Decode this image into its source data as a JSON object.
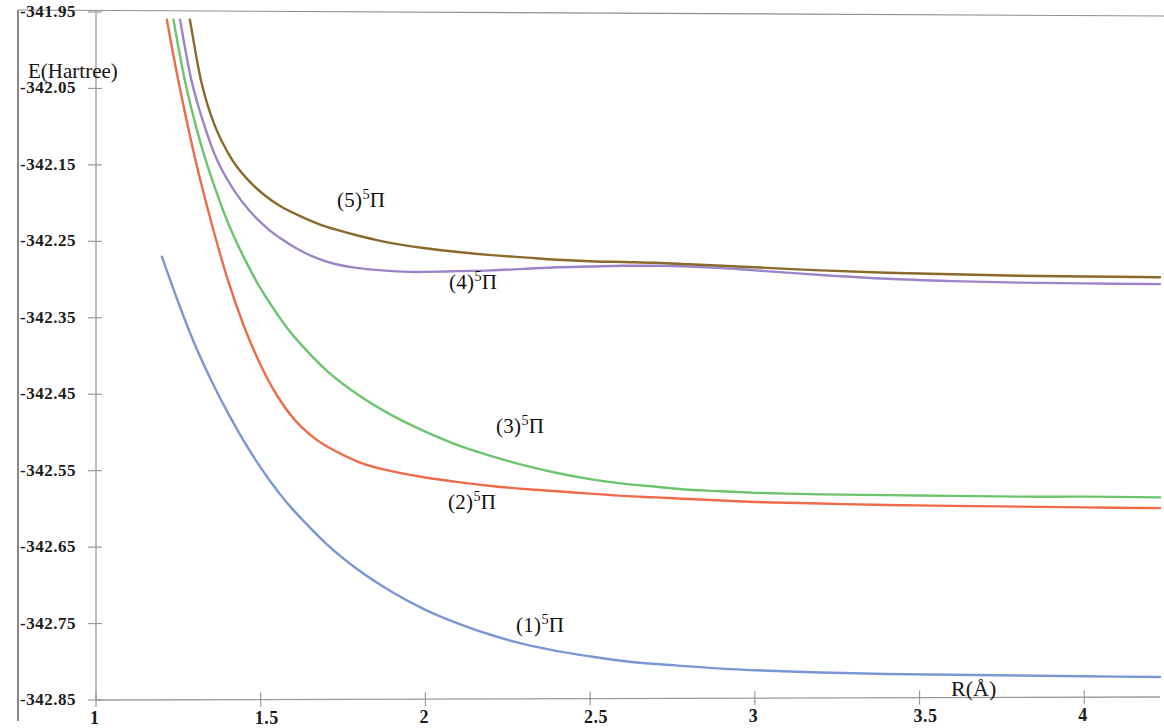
{
  "chart_data": {
    "type": "line",
    "title": "",
    "subtitle": "",
    "xlabel": "R(Å)",
    "ylabel": "E(Hartree)",
    "xlim": [
      1,
      4.23
    ],
    "ylim": [
      -342.85,
      -341.95
    ],
    "grid": false,
    "legend_position": "inline-labels",
    "x_ticks": [
      "1",
      "1.5",
      "2",
      "2.5",
      "3",
      "3.5",
      "4"
    ],
    "x_tick_values": [
      1,
      1.5,
      2,
      2.5,
      3,
      3.5,
      4
    ],
    "y_ticks": [
      "-341.95",
      "-342.05",
      "-342.15",
      "-342.25",
      "-342.35",
      "-342.45",
      "-342.55",
      "-342.65",
      "-342.75",
      "-342.85"
    ],
    "y_tick_values": [
      -341.95,
      -342.05,
      -342.15,
      -342.25,
      -342.35,
      -342.45,
      -342.55,
      -342.65,
      -342.75,
      -342.85
    ],
    "series": [
      {
        "name": "(1)5Pi",
        "label_html": "(1)<sup>5</sup>Π",
        "color": "#7a97d4",
        "x": [
          1.2,
          1.25,
          1.3,
          1.35,
          1.4,
          1.45,
          1.5,
          1.55,
          1.6,
          1.7,
          1.8,
          1.9,
          2.0,
          2.1,
          2.2,
          2.3,
          2.4,
          2.5,
          2.6,
          2.7,
          2.8,
          2.9,
          3.0,
          3.2,
          3.4,
          3.6,
          3.8,
          4.0,
          4.23
        ],
        "y": [
          -342.27,
          -342.33,
          -342.385,
          -342.432,
          -342.474,
          -342.512,
          -342.546,
          -342.576,
          -342.602,
          -342.646,
          -342.681,
          -342.709,
          -342.732,
          -342.75,
          -342.765,
          -342.777,
          -342.786,
          -342.793,
          -342.799,
          -342.803,
          -342.806,
          -342.809,
          -342.811,
          -342.814,
          -342.816,
          -342.817,
          -342.818,
          -342.819,
          -342.82
        ]
      },
      {
        "name": "(2)5Pi",
        "label_html": "(2)<sup>5</sup>Π",
        "color": "#ed6b48",
        "x": [
          1.215,
          1.25,
          1.3,
          1.35,
          1.4,
          1.45,
          1.5,
          1.55,
          1.6,
          1.65,
          1.7,
          1.8,
          1.9,
          2.0,
          2.1,
          2.2,
          2.3,
          2.4,
          2.5,
          2.6,
          2.7,
          2.8,
          2.9,
          3.0,
          3.2,
          3.4,
          3.6,
          3.8,
          4.0,
          4.23
        ],
        "y": [
          -341.96,
          -342.04,
          -342.14,
          -342.225,
          -342.3,
          -342.362,
          -342.412,
          -342.452,
          -342.482,
          -342.503,
          -342.518,
          -342.539,
          -342.551,
          -342.559,
          -342.565,
          -342.57,
          -342.574,
          -342.577,
          -342.58,
          -342.583,
          -342.585,
          -342.587,
          -342.589,
          -342.591,
          -342.593,
          -342.595,
          -342.596,
          -342.597,
          -342.598,
          -342.599
        ]
      },
      {
        "name": "(3)5Pi",
        "label_html": "(3)<sup>5</sup>Π",
        "color": "#6ec46e",
        "x": [
          1.235,
          1.27,
          1.31,
          1.35,
          1.4,
          1.45,
          1.5,
          1.55,
          1.6,
          1.7,
          1.8,
          1.9,
          2.0,
          2.1,
          2.2,
          2.3,
          2.4,
          2.5,
          2.6,
          2.7,
          2.8,
          2.9,
          3.0,
          3.2,
          3.4,
          3.6,
          3.8,
          4.0,
          4.23
        ],
        "y": [
          -341.96,
          -342.04,
          -342.11,
          -342.166,
          -342.225,
          -342.272,
          -342.312,
          -342.345,
          -342.374,
          -342.419,
          -342.452,
          -342.478,
          -342.499,
          -342.517,
          -342.531,
          -342.543,
          -342.553,
          -342.561,
          -342.567,
          -342.571,
          -342.575,
          -342.577,
          -342.579,
          -342.581,
          -342.582,
          -342.583,
          -342.584,
          -342.584,
          -342.585
        ]
      },
      {
        "name": "(4)5Pi",
        "label_html": "(4)<sup>5</sup>Π",
        "color": "#9b85c8",
        "x": [
          1.255,
          1.29,
          1.33,
          1.37,
          1.42,
          1.47,
          1.52,
          1.57,
          1.62,
          1.67,
          1.72,
          1.78,
          1.84,
          1.9,
          1.95,
          2.0,
          2.1,
          2.2,
          2.3,
          2.4,
          2.5,
          2.6,
          2.7,
          2.8,
          2.9,
          3.0,
          3.2,
          3.4,
          3.6,
          3.8,
          4.0,
          4.23
        ],
        "y": [
          -341.96,
          -342.04,
          -342.1,
          -342.146,
          -342.184,
          -342.212,
          -342.233,
          -342.249,
          -342.262,
          -342.272,
          -342.279,
          -342.284,
          -342.287,
          -342.289,
          -342.29,
          -342.29,
          -342.289,
          -342.288,
          -342.286,
          -342.284,
          -342.283,
          -342.282,
          -342.282,
          -342.283,
          -342.285,
          -342.288,
          -342.294,
          -342.299,
          -342.302,
          -342.304,
          -342.305,
          -342.306
        ]
      },
      {
        "name": "(5)5Pi",
        "label_html": "(5)<sup>5</sup>Π",
        "color": "#8a6a2c",
        "x": [
          1.285,
          1.32,
          1.36,
          1.41,
          1.46,
          1.51,
          1.56,
          1.62,
          1.68,
          1.74,
          1.8,
          1.86,
          1.92,
          2.0,
          2.1,
          2.2,
          2.3,
          2.4,
          2.5,
          2.6,
          2.7,
          2.8,
          2.9,
          3.0,
          3.2,
          3.4,
          3.6,
          3.8,
          4.0,
          4.23
        ],
        "y": [
          -341.96,
          -342.042,
          -342.098,
          -342.141,
          -342.169,
          -342.189,
          -342.204,
          -342.217,
          -342.228,
          -342.236,
          -342.243,
          -342.249,
          -342.254,
          -342.259,
          -342.264,
          -342.268,
          -342.271,
          -342.274,
          -342.276,
          -342.277,
          -342.278,
          -342.28,
          -342.282,
          -342.284,
          -342.288,
          -342.291,
          -342.293,
          -342.295,
          -342.296,
          -342.297
        ]
      }
    ],
    "annotations": [
      {
        "text_html": "(5)<sup>5</sup>Π",
        "x_px": 337,
        "y_px": 188
      },
      {
        "text_html": "(4)<sup>5</sup>Π",
        "x_px": 449,
        "y_px": 270
      },
      {
        "text_html": "(3)<sup>5</sup>Π",
        "x_px": 496,
        "y_px": 414
      },
      {
        "text_html": "(2)<sup>5</sup>Π",
        "x_px": 448,
        "y_px": 490
      },
      {
        "text_html": "(1)<sup>5</sup>Π",
        "x_px": 516,
        "y_px": 613
      }
    ]
  },
  "axes": {
    "y_axis_title": "E(Hartree)",
    "x_axis_title": "R(Å)"
  }
}
